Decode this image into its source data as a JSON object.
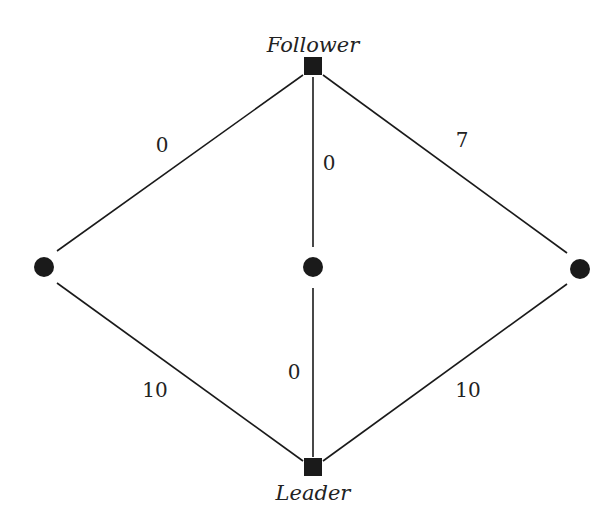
{
  "diagram": {
    "type": "graph",
    "nodes": [
      {
        "id": "follower",
        "label": "Follower",
        "shape": "square",
        "x": 313,
        "y": 66
      },
      {
        "id": "leader",
        "label": "Leader",
        "shape": "square",
        "x": 313,
        "y": 467
      },
      {
        "id": "left",
        "label": "",
        "shape": "circle",
        "x": 44,
        "y": 267
      },
      {
        "id": "center",
        "label": "",
        "shape": "circle",
        "x": 313,
        "y": 267
      },
      {
        "id": "right",
        "label": "",
        "shape": "circle",
        "x": 580,
        "y": 269
      }
    ],
    "edges": [
      {
        "from": "follower",
        "to": "left",
        "weight": "0"
      },
      {
        "from": "follower",
        "to": "center",
        "weight": "0"
      },
      {
        "from": "follower",
        "to": "right",
        "weight": "7"
      },
      {
        "from": "leader",
        "to": "left",
        "weight": "10"
      },
      {
        "from": "leader",
        "to": "center",
        "weight": "0"
      },
      {
        "from": "leader",
        "to": "right",
        "weight": "10"
      }
    ],
    "colors": {
      "ink": "#1a1a1a",
      "background": "#ffffff"
    }
  }
}
